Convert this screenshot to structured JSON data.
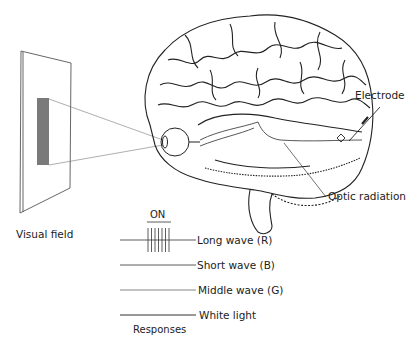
{
  "figure": {
    "labels": {
      "electrode": "Electrode",
      "optic_radiation": "Optic radiation",
      "visual_field": "Visual field",
      "responses": "Responses",
      "on": "ON"
    },
    "traces": [
      {
        "label": "Long wave (R)",
        "response": "spikes during ON"
      },
      {
        "label": "Short wave (B)",
        "response": "none"
      },
      {
        "label": "Middle wave (G)",
        "response": "none"
      },
      {
        "label": "White light",
        "response": "none"
      }
    ],
    "colors": {
      "stimulus_bar": "#7a7a7a",
      "line": "#333333",
      "background": "#ffffff"
    }
  }
}
